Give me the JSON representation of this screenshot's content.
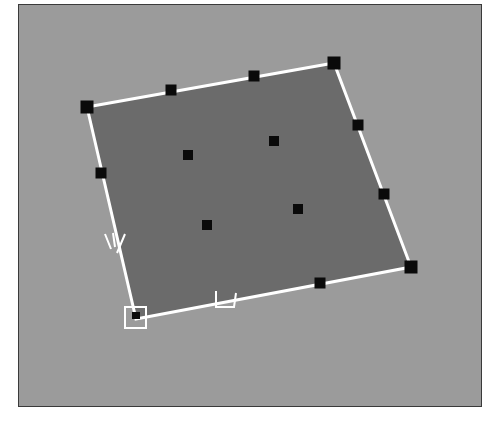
{
  "viewport": {
    "background_color": "#9b9b9b",
    "frame_color": "#3a3a3a"
  },
  "patch": {
    "fill_color": "#6b6b6b",
    "edge_color": "#ffffff",
    "handle_color": "#0a0a0a",
    "corners": [
      {
        "id": "top-left",
        "x": 86,
        "y": 106
      },
      {
        "id": "top-right",
        "x": 333,
        "y": 62
      },
      {
        "id": "bottom-right",
        "x": 410,
        "y": 266
      },
      {
        "id": "bottom-left-origin",
        "x": 135,
        "y": 318
      }
    ],
    "edge_handles": [
      {
        "id": "top-1",
        "x": 170,
        "y": 89
      },
      {
        "id": "top-2",
        "x": 253,
        "y": 75
      },
      {
        "id": "right-1",
        "x": 357,
        "y": 124
      },
      {
        "id": "right-2",
        "x": 383,
        "y": 193
      },
      {
        "id": "bottom-1",
        "x": 319,
        "y": 282
      },
      {
        "id": "left-1",
        "x": 100,
        "y": 172
      }
    ],
    "interior_handles": [
      {
        "id": "inner-1",
        "x": 187,
        "y": 154
      },
      {
        "id": "inner-2",
        "x": 273,
        "y": 140
      },
      {
        "id": "inner-3",
        "x": 297,
        "y": 208
      },
      {
        "id": "inner-4",
        "x": 206,
        "y": 224
      }
    ]
  },
  "axis_labels": {
    "u": "U",
    "v": "V"
  }
}
